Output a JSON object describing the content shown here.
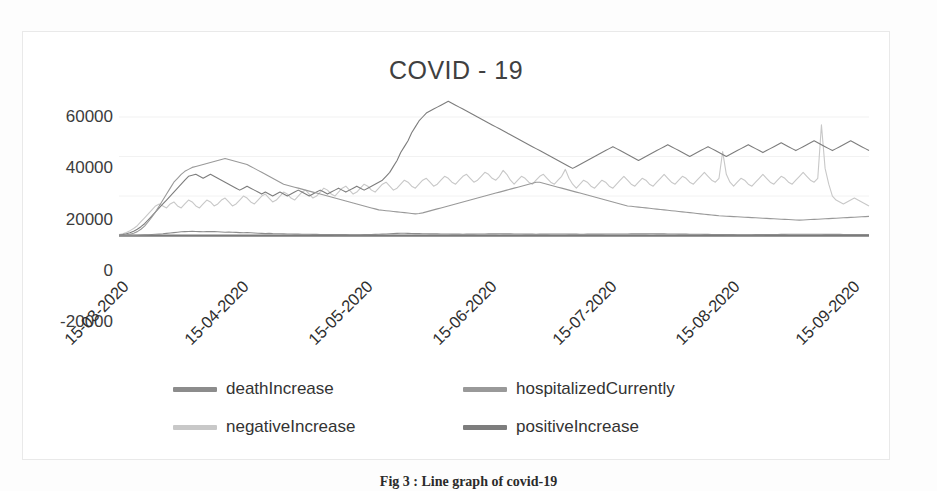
{
  "figure": {
    "caption": "Fig 3 : Line graph of covid-19"
  },
  "chart_data": {
    "type": "line",
    "title": "COVID - 19",
    "xlabel": "",
    "ylabel": "",
    "ylim": [
      -20000,
      60000
    ],
    "yticks": [
      "60000",
      "40000",
      "20000",
      "0",
      "-20000"
    ],
    "ytick_values": [
      60000,
      40000,
      20000,
      0,
      -20000
    ],
    "grid": true,
    "legend_position": "bottom",
    "xticks": [
      "15-03-2020",
      "15-04-2020",
      "15-05-2020",
      "15-06-2020",
      "15-07-2020",
      "15-08-2020",
      "15-09-2020"
    ],
    "xtick_positions": [
      0,
      16.0,
      32.5,
      49.0,
      65.0,
      81.5,
      97.5
    ],
    "series": [
      {
        "name": "deathIncrease",
        "color": "#8c8c8c",
        "values": [
          20,
          35,
          55,
          80,
          120,
          190,
          260,
          340,
          430,
          520,
          640,
          760,
          900,
          1100,
          1300,
          1500,
          1700,
          1900,
          2000,
          2100,
          2200,
          2100,
          2000,
          1900,
          2000,
          2100,
          2000,
          1900,
          1800,
          1700,
          1800,
          1700,
          1600,
          1500,
          1400,
          1500,
          1400,
          1300,
          1200,
          1100,
          1000,
          1100,
          1000,
          950,
          900,
          850,
          800,
          780,
          760,
          740,
          700,
          680,
          650,
          620,
          600,
          580,
          560,
          540,
          520,
          500,
          480,
          470,
          460,
          450,
          440,
          430,
          450,
          470,
          500,
          530,
          600,
          680,
          750,
          820,
          900,
          1000,
          1100,
          1200,
          1150,
          1100,
          1050,
          1000,
          980,
          950,
          900,
          880,
          860,
          840,
          820,
          800,
          780,
          760,
          740,
          720,
          700,
          720,
          740,
          760,
          780,
          800,
          820,
          840,
          860,
          880,
          900,
          880,
          860,
          840,
          820,
          800,
          780,
          760,
          740,
          720,
          700,
          720,
          740,
          760,
          780,
          800,
          820,
          800,
          780,
          760,
          740,
          720,
          700,
          710,
          720,
          730,
          740,
          750,
          760,
          770,
          780,
          790,
          800,
          810,
          820,
          830,
          840,
          850,
          860,
          870,
          880,
          890,
          900,
          880,
          860,
          840,
          820,
          800,
          780,
          760,
          740,
          720,
          700,
          680,
          660,
          640,
          620,
          600,
          580,
          560,
          540,
          520,
          500,
          480,
          460,
          440,
          420,
          400,
          420,
          440,
          460,
          480,
          500,
          520,
          540,
          560,
          580,
          600,
          620,
          640,
          660,
          680,
          700,
          690,
          680,
          670,
          660,
          650,
          640,
          630,
          620,
          610,
          600,
          590,
          580,
          570,
          560,
          550,
          540,
          530,
          520,
          510
        ]
      },
      {
        "name": "hospitalizedCurrently",
        "color": "#999999",
        "values": [
          100,
          200,
          400,
          700,
          1200,
          2000,
          3200,
          4800,
          7000,
          9500,
          12000,
          15000,
          18000,
          21000,
          24000,
          27000,
          29000,
          31000,
          32500,
          33500,
          34500,
          35000,
          35500,
          36000,
          36500,
          37000,
          37500,
          38000,
          38500,
          39000,
          38500,
          38000,
          37500,
          37000,
          36500,
          36000,
          35000,
          34000,
          33000,
          32000,
          31000,
          30000,
          29000,
          28000,
          27000,
          26000,
          25500,
          25000,
          24500,
          24000,
          23500,
          23000,
          22500,
          22000,
          21500,
          21000,
          20500,
          20000,
          19500,
          19000,
          18500,
          18000,
          17500,
          17000,
          16500,
          16000,
          15500,
          15000,
          14500,
          14000,
          13500,
          13000,
          12800,
          12600,
          12400,
          12200,
          12000,
          11800,
          11600,
          11400,
          11200,
          11000,
          11200,
          11500,
          12000,
          12500,
          13000,
          13500,
          14000,
          14500,
          15000,
          15500,
          16000,
          16500,
          17000,
          17500,
          18000,
          18500,
          19000,
          19500,
          20000,
          20500,
          21000,
          21500,
          22000,
          22500,
          23000,
          23500,
          24000,
          24500,
          25000,
          25500,
          26000,
          26500,
          27000,
          27000,
          26500,
          26000,
          25500,
          25000,
          24500,
          24000,
          23500,
          23000,
          22500,
          22000,
          21500,
          21000,
          20500,
          20000,
          19500,
          19000,
          18500,
          18000,
          17500,
          17000,
          16500,
          16000,
          15500,
          15000,
          14800,
          14600,
          14400,
          14200,
          14000,
          13800,
          13600,
          13400,
          13200,
          13000,
          12800,
          12600,
          12400,
          12200,
          12000,
          11800,
          11600,
          11400,
          11200,
          11000,
          10800,
          10600,
          10400,
          10200,
          10000,
          9900,
          9800,
          9700,
          9600,
          9500,
          9400,
          9300,
          9200,
          9100,
          9000,
          8900,
          8800,
          8700,
          8600,
          8500,
          8400,
          8300,
          8200,
          8100,
          8000,
          7900,
          7800,
          7900,
          8000,
          8100,
          8200,
          8300,
          8400,
          8500,
          8600,
          8700,
          8800,
          8900,
          9000,
          9100,
          9200,
          9300,
          9400,
          9500,
          9600,
          9700
        ]
      },
      {
        "name": "negativeIncrease",
        "color": "#c8c8c8",
        "values": [
          500,
          900,
          1600,
          2500,
          3600,
          5000,
          7000,
          9000,
          11000,
          13000,
          15000,
          16000,
          15000,
          14000,
          16000,
          17000,
          15000,
          14000,
          16000,
          18000,
          17000,
          15000,
          14000,
          16000,
          18000,
          17000,
          15000,
          16000,
          18000,
          19000,
          17000,
          15000,
          16000,
          18000,
          20000,
          19000,
          17000,
          16000,
          18000,
          20000,
          21000,
          19000,
          17000,
          18000,
          20000,
          22000,
          21000,
          19000,
          18000,
          20000,
          22000,
          23000,
          21000,
          19000,
          20000,
          22000,
          24000,
          23000,
          21000,
          20000,
          22000,
          24000,
          25000,
          23000,
          21000,
          22000,
          24000,
          26000,
          25000,
          23000,
          22000,
          24000,
          26000,
          27000,
          25000,
          23000,
          24000,
          26000,
          28000,
          27000,
          25000,
          24000,
          26000,
          28000,
          29000,
          27000,
          25000,
          26000,
          28000,
          30000,
          29000,
          27000,
          26000,
          28000,
          30000,
          31000,
          29000,
          27000,
          28000,
          30000,
          32000,
          31000,
          29000,
          28000,
          30000,
          33000,
          31000,
          28000,
          26000,
          28000,
          30000,
          29000,
          27000,
          26000,
          28000,
          30000,
          31000,
          29000,
          27000,
          26000,
          28000,
          30000,
          33500,
          29000,
          26000,
          24000,
          26000,
          28000,
          27000,
          25000,
          24000,
          26000,
          28000,
          27000,
          25000,
          24000,
          26000,
          28000,
          30000,
          28000,
          26000,
          25000,
          27000,
          29000,
          28000,
          26000,
          25000,
          27000,
          29000,
          31000,
          29000,
          27000,
          26000,
          28000,
          30000,
          29000,
          27000,
          26000,
          28000,
          30000,
          32000,
          30000,
          28000,
          27000,
          29000,
          42500,
          31000,
          27000,
          25000,
          27000,
          29000,
          28000,
          26000,
          25000,
          27000,
          29000,
          31000,
          29000,
          27000,
          26000,
          28000,
          30000,
          29000,
          27000,
          26000,
          28000,
          30000,
          32000,
          30000,
          28000,
          27000,
          29000,
          56000,
          34000,
          26000,
          20000,
          18000,
          17000,
          16000,
          17000,
          18000,
          19000,
          18000,
          17000,
          16000,
          15000
        ]
      },
      {
        "name": "positiveIncrease",
        "color": "#7d7d7d",
        "values": [
          300,
          500,
          900,
          1400,
          2200,
          3200,
          4500,
          6000,
          8000,
          10000,
          12000,
          14000,
          16000,
          18000,
          20000,
          22000,
          24000,
          26000,
          28000,
          30000,
          30500,
          31000,
          30000,
          29000,
          30000,
          31000,
          30000,
          29000,
          28000,
          27000,
          26000,
          25000,
          24000,
          23000,
          24000,
          25000,
          24000,
          23000,
          22000,
          21000,
          22000,
          21000,
          20000,
          21000,
          22000,
          21000,
          20000,
          21000,
          22000,
          23000,
          22000,
          21000,
          20000,
          21000,
          22000,
          23000,
          22000,
          21000,
          22000,
          23000,
          24000,
          23000,
          22000,
          23000,
          24000,
          25000,
          24000,
          23000,
          24000,
          25000,
          26000,
          27000,
          28000,
          30000,
          32000,
          35000,
          38000,
          42000,
          45000,
          48000,
          52000,
          55000,
          58000,
          60000,
          62000,
          63000,
          64000,
          65000,
          66000,
          67000,
          68000,
          67000,
          66000,
          65000,
          64000,
          63000,
          62000,
          61000,
          60000,
          59000,
          58000,
          57000,
          56000,
          55000,
          54000,
          53000,
          52000,
          51000,
          50000,
          49000,
          48000,
          47000,
          46000,
          45000,
          44000,
          43000,
          42000,
          41000,
          40000,
          39000,
          38000,
          37000,
          36000,
          35000,
          34000,
          35000,
          36000,
          37000,
          38000,
          39000,
          40000,
          41000,
          42000,
          43000,
          44000,
          45000,
          44000,
          43000,
          42000,
          41000,
          40000,
          39000,
          38000,
          39000,
          40000,
          41000,
          42000,
          43000,
          44000,
          45000,
          46000,
          45000,
          44000,
          43000,
          42000,
          41000,
          40000,
          41000,
          42000,
          43000,
          44000,
          45000,
          44000,
          43000,
          42000,
          41000,
          40000,
          41000,
          42000,
          43000,
          44000,
          45000,
          46000,
          45000,
          44000,
          43000,
          42000,
          43000,
          44000,
          45000,
          46000,
          47000,
          46000,
          45000,
          44000,
          43000,
          44000,
          45000,
          46000,
          47000,
          48000,
          47000,
          46000,
          45000,
          44000,
          43000,
          44000,
          45000,
          46000,
          47000,
          48000,
          47000,
          46000,
          45000,
          44000,
          43000
        ]
      }
    ]
  },
  "legend": {
    "items": [
      {
        "label": "deathIncrease",
        "color": "#8c8c8c"
      },
      {
        "label": "hospitalizedCurrently",
        "color": "#999999"
      },
      {
        "label": "negativeIncrease",
        "color": "#c8c8c8"
      },
      {
        "label": "positiveIncrease",
        "color": "#7d7d7d"
      }
    ]
  }
}
